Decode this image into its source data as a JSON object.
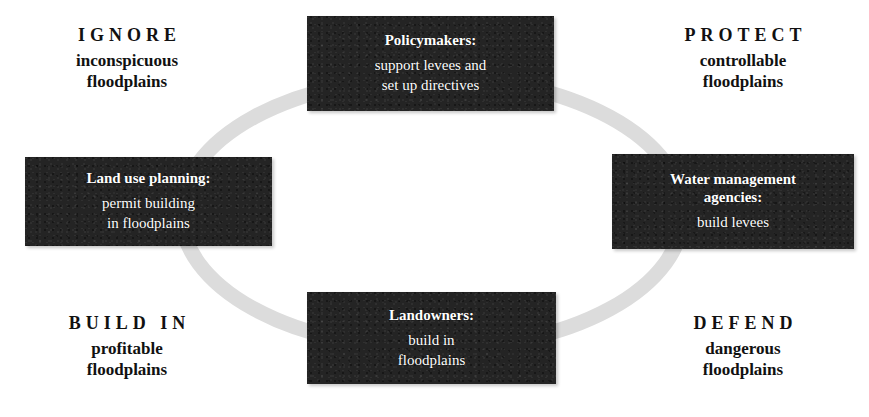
{
  "diagram": {
    "ring": {
      "shape": "ellipse",
      "color": "#dcdcdc",
      "stroke_width": 15,
      "center": [
        432,
        213
      ],
      "radius_x": 251,
      "radius_y": 136,
      "arrowheads": false
    },
    "box_color": "#242424",
    "box_text_color": "#ffffff",
    "label_text_color": "#111111"
  },
  "actors": [
    {
      "id": "policymakers",
      "position": "top",
      "title": "Policymakers:",
      "lines": [
        "support levees and",
        "set up directives"
      ]
    },
    {
      "id": "land-use-planning",
      "position": "left",
      "title": "Land use planning:",
      "lines": [
        "permit building",
        "in floodplains"
      ]
    },
    {
      "id": "water-management-agencies",
      "position": "right",
      "title_lines": [
        "Water management",
        "agencies:"
      ],
      "title": "Water management agencies:",
      "lines": [
        "build levees"
      ]
    },
    {
      "id": "landowners",
      "position": "bottom",
      "title": "Landowners:",
      "lines": [
        "build in",
        "floodplains"
      ]
    }
  ],
  "strategies": [
    {
      "id": "ignore",
      "corner": "top-left",
      "keyword": "IGNORE",
      "descriptor_lines": [
        "inconspicuous",
        "floodplains"
      ]
    },
    {
      "id": "protect",
      "corner": "top-right",
      "keyword": "PROTECT",
      "descriptor_lines": [
        "controllable",
        "floodplains"
      ]
    },
    {
      "id": "build-in",
      "corner": "bottom-left",
      "keyword": "BUILD IN",
      "descriptor_lines": [
        "profitable",
        "floodplains"
      ]
    },
    {
      "id": "defend",
      "corner": "bottom-right",
      "keyword": "DEFEND",
      "descriptor_lines": [
        "dangerous",
        "floodplains"
      ]
    }
  ]
}
